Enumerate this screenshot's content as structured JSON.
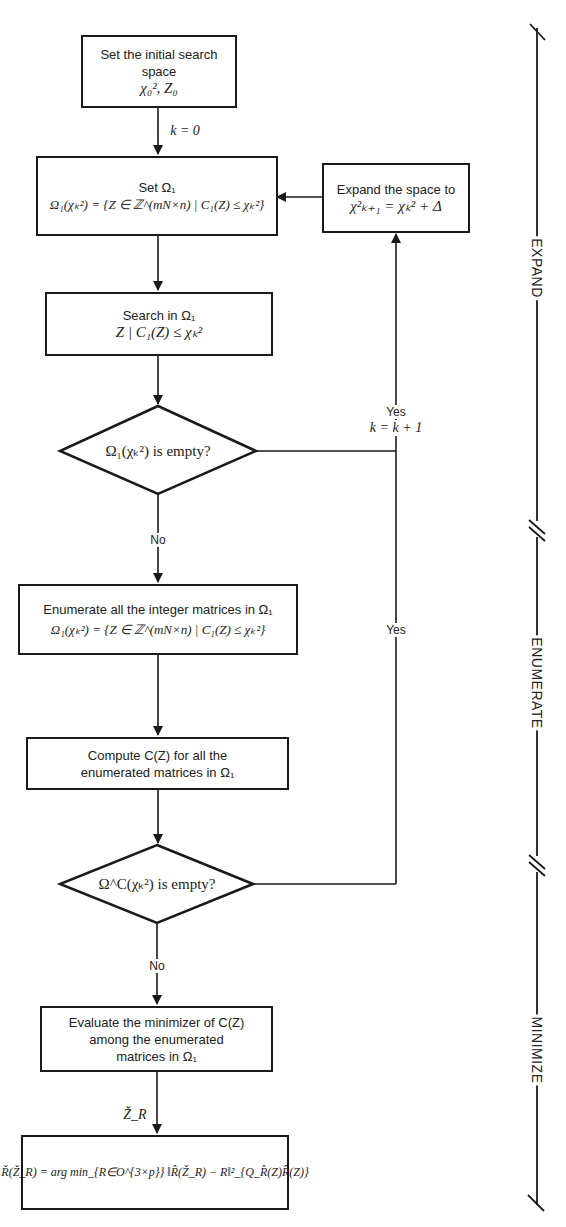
{
  "diagram": {
    "type": "flowchart",
    "nodes": {
      "init": {
        "title": "Set the initial search space",
        "math": "χ₀², Z₀"
      },
      "set_omega": {
        "title": "Set Ω₁",
        "math": "Ω₁(χₖ²) = {Z ∈ ℤ^(mN×n) | C₁(Z) ≤ χₖ²}"
      },
      "expand": {
        "title": "Expand the space to",
        "math": "χ²ₖ₊₁ = χₖ² + Δ"
      },
      "search": {
        "title": "Search in Ω₁",
        "math": "Z | C₁(Z) ≤ χₖ²"
      },
      "decision1": {
        "text": "Ω₁(χₖ²) is empty?"
      },
      "enumerate": {
        "title": "Enumerate all the integer matrices in  Ω₁",
        "math": "Ω₁(χₖ²) = {Z ∈ ℤ^(mN×n) | C₁(Z) ≤ χₖ²}"
      },
      "compute": {
        "line1": "Compute C(Z) for all the",
        "line2": "enumerated matrices in  Ω₁"
      },
      "decision2": {
        "text": "Ω^C(χₖ²) is empty?"
      },
      "evaluate": {
        "line1": "Evaluate the minimizer of C(Z)",
        "line2": "among the enumerated",
        "line3": "matrices in Ω₁"
      },
      "result": {
        "math": "Ř(Ž_R) = arg min_{R∈O^{3×p}} ‖R̂(Ž_R) − R‖²_{Q_R̂(Z)R̂(Z)}"
      }
    },
    "edge_labels": {
      "k0": "k = 0",
      "yes1": "Yes",
      "k_inc": "k = k + 1",
      "yes2": "Yes",
      "no1": "No",
      "no2": "No",
      "zr": "Ž_R"
    },
    "phases": [
      "EXPAND",
      "ENUMERATE",
      "MINIMIZE"
    ]
  }
}
